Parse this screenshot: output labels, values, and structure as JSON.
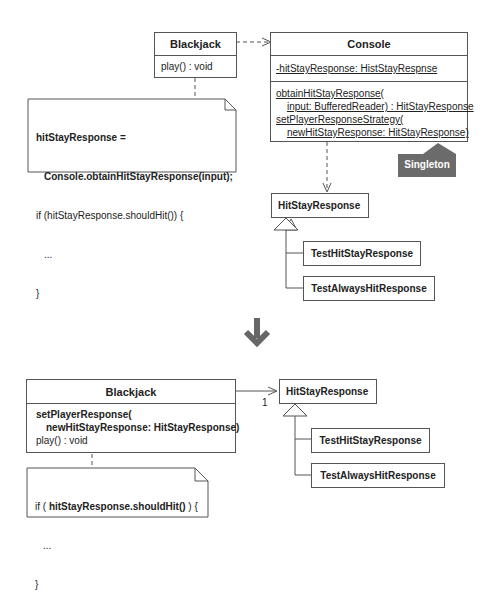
{
  "before": {
    "blackjack": {
      "name": "Blackjack",
      "operations": [
        "play() : void"
      ]
    },
    "note": {
      "line1": "hitStayResponse =",
      "line2": "Console.obtainHitStayResponse(input);",
      "line3": "if (hitStayResponse.shouldHit()) {",
      "line4": "...",
      "line5": "}"
    },
    "console": {
      "name": "Console",
      "attribute": "-hitStayResponse: HistStayRespnse",
      "op1_line1": "obtainHitStayResponse(",
      "op1_line2": "input: BufferedReader) : HitStayResponse",
      "op2_line1": "setPlayerResponseStrategy(",
      "op2_line2": "newHitStayResponse: HitStayResponse)"
    },
    "singleton_tag": "Singleton",
    "hit_stay_response": "HitStayResponse",
    "subclasses": [
      "TestHitStayResponse",
      "TestAlwaysHitResponse"
    ]
  },
  "arrow_glyph": "down-arrow-icon",
  "after": {
    "blackjack": {
      "name": "Blackjack",
      "op1_line1": "setPlayerResponse(",
      "op1_line2": "newHitStayResponse: HitStayResponse)",
      "op2": "play() : void"
    },
    "multiplicity": "1",
    "note": {
      "line1_prefix": "if ( ",
      "line1_bold": "hitStayResponse.shouldHit()",
      "line1_suffix": " ) {",
      "line2": "...",
      "line3": "}"
    },
    "hit_stay_response": "HitStayResponse",
    "subclasses": [
      "TestHitStayResponse",
      "TestAlwaysHitResponse"
    ]
  }
}
